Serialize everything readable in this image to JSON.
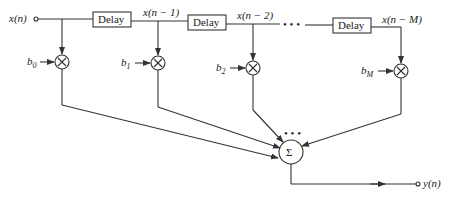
{
  "diagram": {
    "type": "FIR filter direct-form block diagram",
    "input_label": "x(n)",
    "output_label": "y(n)",
    "delay_label": "Delay",
    "tap_labels": [
      "x(n − 1)",
      "x(n − 2)",
      "x(n − M)"
    ],
    "coefficients": [
      {
        "base": "b",
        "sub": "0"
      },
      {
        "base": "b",
        "sub": "1"
      },
      {
        "base": "b",
        "sub": "2"
      },
      {
        "base": "b",
        "sub": "M"
      }
    ],
    "multiplier_symbol": "×",
    "sum_symbol": "Σ",
    "ellipsis": "• • •",
    "sum_ellipsis": "• • •",
    "colors": {
      "stroke": "#333333",
      "text": "#222222",
      "background": "#ffffff"
    }
  }
}
